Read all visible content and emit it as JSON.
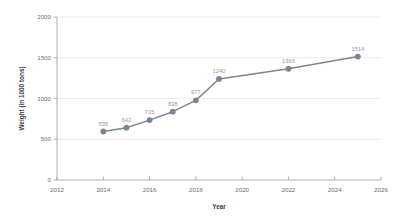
{
  "chart_data": {
    "type": "line",
    "title": "",
    "xlabel": "Year",
    "ylabel": "Weight (in 1000 tons)",
    "x": [
      2014,
      2015,
      2016,
      2017,
      2018,
      2019,
      2022,
      2025
    ],
    "values": [
      595,
      642,
      735,
      838,
      977,
      1240,
      1365,
      1514
    ],
    "point_labels": [
      "595",
      "642",
      "735",
      "838",
      "977",
      "1240",
      "1365",
      "1514"
    ],
    "xlim": [
      2012,
      2026
    ],
    "ylim": [
      0,
      2000
    ],
    "x_ticks": [
      2012,
      2014,
      2016,
      2018,
      2020,
      2022,
      2024,
      2026
    ],
    "x_tick_labels": [
      "2012",
      "2014",
      "2016",
      "2018",
      "2020",
      "2022",
      "2024",
      "2026"
    ],
    "y_ticks": [
      0,
      500,
      1000,
      1500,
      2000
    ],
    "y_tick_labels": [
      "0",
      "500",
      "1000",
      "1500",
      "2000"
    ],
    "grid": "horizontal",
    "legend": "none",
    "series_color": "#7b8594",
    "label_color": "#9b9ba0",
    "axis_color": "#9a9a9e",
    "grid_color": "#e8e8ea",
    "background": "#ffffff"
  }
}
